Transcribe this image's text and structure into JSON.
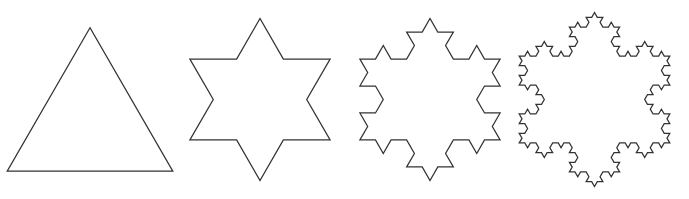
{
  "figure": {
    "background_color": "#ffffff",
    "stroke_color": "#333333",
    "stroke_width": 1.25,
    "canvas": {
      "width": 689,
      "height": 199
    },
    "shape_count": 4
  },
  "chart_data": {
    "type": "diagram",
    "xlabel": "",
    "ylabel": "",
    "categories": [
      "Iteration 0",
      "Iteration 1",
      "Iteration 2",
      "Iteration 3"
    ],
    "values": [
      3,
      12,
      48,
      192
    ],
    "series": [
      {
        "name": "Number of edges",
        "values": [
          3,
          12,
          48,
          192
        ]
      },
      {
        "name": "Relative perimeter",
        "values": [
          1,
          1.333,
          1.778,
          2.37
        ]
      }
    ]
  },
  "shapes": [
    {
      "id": "koch-iteration-0",
      "name": "Equilateral triangle",
      "iteration": 0,
      "edges": 3,
      "vertices": 3,
      "apex_x": 95,
      "apex_y": 19,
      "base_left_x": 22,
      "base_right_x": 168,
      "base_y": 138,
      "side_length": 146
    },
    {
      "id": "koch-iteration-1",
      "name": "Six-pointed star",
      "iteration": 1,
      "edges": 12,
      "vertices": 12,
      "apex_x": 258,
      "apex_y": 8,
      "bottom_tip_x": 259,
      "bottom_tip_y": 182,
      "left_x": 185,
      "right_x": 332
    },
    {
      "id": "koch-iteration-2",
      "name": "Koch snowflake second iteration",
      "iteration": 2,
      "edges": 48,
      "vertices": 48,
      "apex_x": 428,
      "apex_y": 10,
      "bottom_tip_y": 180,
      "left_x": 352,
      "right_x": 505
    },
    {
      "id": "koch-iteration-3",
      "name": "Koch snowflake third iteration",
      "iteration": 3,
      "edges": 192,
      "vertices": 192,
      "apex_x": 590,
      "apex_y": 10,
      "bottom_tip_y": 180,
      "left_x": 515,
      "right_x": 665
    }
  ],
  "geometry": {
    "view_box": "0 0 100 100",
    "triangle_top": [
      50,
      6.5
    ],
    "triangle_left": [
      6.7,
      81.5
    ],
    "triangle_right": [
      93.3,
      81.5
    ],
    "note": "Base triangle inscribed in the panel; each iteration replaces the middle third of every edge with an outward equilateral bump."
  }
}
